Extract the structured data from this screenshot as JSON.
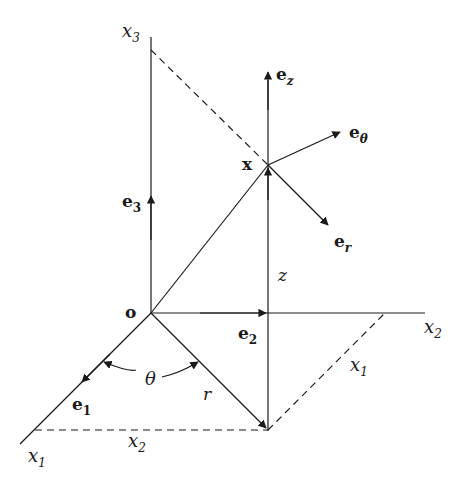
{
  "diagram": {
    "colors": {
      "line": "#1a1a1a",
      "background": "#ffffff"
    },
    "points": {
      "origin": {
        "label": "o",
        "x": 151,
        "y": 313
      },
      "x_point": {
        "label": "x",
        "x": 268,
        "y": 165
      },
      "projection": {
        "x": 268,
        "y": 430
      }
    },
    "axes": {
      "x1": {
        "label": "x",
        "sub": "1"
      },
      "x2": {
        "label": "x",
        "sub": "2"
      },
      "x3": {
        "label": "x",
        "sub": "3"
      }
    },
    "basis_vectors": {
      "e1": {
        "label": "e",
        "sub": "1"
      },
      "e2": {
        "label": "e",
        "sub": "2"
      },
      "e3": {
        "label": "e",
        "sub": "3"
      },
      "ez": {
        "label": "e",
        "sub": "z"
      },
      "etheta": {
        "label": "e",
        "sub": "θ"
      },
      "er": {
        "label": "e",
        "sub": "r"
      }
    },
    "measures": {
      "theta": "θ",
      "r": "r",
      "z": "z",
      "x1_dim": {
        "label": "x",
        "sub": "1"
      },
      "x2_dim": {
        "label": "x",
        "sub": "2"
      }
    }
  }
}
